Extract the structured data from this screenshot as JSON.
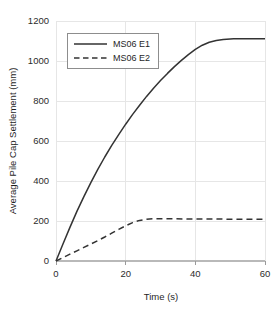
{
  "chart_data": {
    "type": "line",
    "title": "",
    "xlabel": "Time (s)",
    "ylabel": "Average Pile Cap Settlement (mm)",
    "xlim": [
      0,
      60
    ],
    "ylim": [
      0,
      1200
    ],
    "xticks": [
      0,
      20,
      40,
      60
    ],
    "yticks": [
      0,
      200,
      400,
      600,
      800,
      1000,
      1200
    ],
    "xtick_labels": [
      "0",
      "20",
      "40",
      "60"
    ],
    "ytick_labels": [
      "0",
      "200",
      "400",
      "600",
      "800",
      "1000",
      "1200"
    ],
    "grid": true,
    "legend_position": "upper-left-inside",
    "series": [
      {
        "name": "MS06 E1",
        "style": "solid",
        "color": "#333333",
        "x": [
          0,
          2,
          4,
          6,
          8,
          10,
          12,
          14,
          16,
          18,
          20,
          22,
          24,
          26,
          28,
          30,
          32,
          34,
          36,
          38,
          40,
          42,
          44,
          46,
          48,
          50,
          51,
          54,
          57,
          60
        ],
        "y": [
          0,
          85,
          168,
          248,
          322,
          392,
          458,
          520,
          578,
          632,
          684,
          733,
          779,
          823,
          864,
          902,
          938,
          972,
          1003,
          1032,
          1058,
          1079,
          1094,
          1103,
          1108,
          1110,
          1111,
          1111,
          1111,
          1111
        ]
      },
      {
        "name": "MS06 E2",
        "style": "dashed",
        "color": "#333333",
        "x": [
          0,
          2,
          4,
          6,
          8,
          10,
          12,
          14,
          16,
          18,
          20,
          22,
          24,
          26,
          28,
          30,
          34,
          38,
          42,
          46,
          50,
          54,
          57,
          60
        ],
        "y": [
          0,
          17,
          34,
          51,
          68,
          85,
          102,
          120,
          139,
          158,
          176,
          192,
          203,
          209,
          211,
          211,
          211,
          210,
          210,
          210,
          209,
          209,
          209,
          209
        ]
      }
    ]
  },
  "legend": {
    "entries": [
      {
        "label": "MS06 E1",
        "style": "solid"
      },
      {
        "label": "MS06 E2",
        "style": "dashed"
      }
    ]
  },
  "colors": {
    "line": "#333333",
    "grid": "#e6e6e6",
    "axis": "#b9b9b9",
    "text": "#1f1f1f",
    "background": "#ffffff"
  }
}
